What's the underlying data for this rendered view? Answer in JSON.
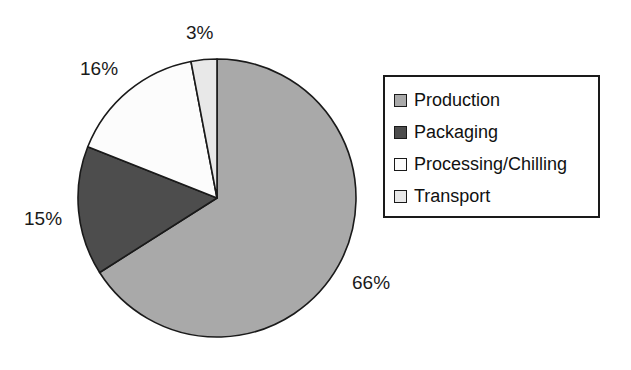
{
  "chart_data": {
    "type": "pie",
    "title": "",
    "subtitle": "",
    "xlabel": "",
    "ylabel": "",
    "legend_position": "right",
    "grid": false,
    "start_angle_deg": 0,
    "direction": "clockwise",
    "categories": [
      "Production",
      "Packaging",
      "Processing/Chilling",
      "Transport"
    ],
    "values": [
      66,
      15,
      16,
      3
    ],
    "value_unit": "%",
    "data_labels": [
      "66%",
      "15%",
      "16%",
      "3%"
    ],
    "colors": [
      "#a9a9a9",
      "#4d4d4d",
      "#fcfcfc",
      "#e8e8e8"
    ],
    "slices": [
      {
        "label": "Production",
        "value": 66,
        "display": "66%",
        "color": "#a9a9a9"
      },
      {
        "label": "Packaging",
        "value": 15,
        "display": "15%",
        "color": "#4d4d4d"
      },
      {
        "label": "Processing/Chilling",
        "value": 16,
        "display": "16%",
        "color": "#fcfcfc"
      },
      {
        "label": "Transport",
        "value": 3,
        "display": "3%",
        "color": "#e8e8e8"
      }
    ]
  },
  "labels": {
    "production": "66%",
    "packaging": "15%",
    "processing": "16%",
    "transport": "3%"
  },
  "legend": {
    "items": [
      {
        "label": "Production",
        "swatch": "#a9a9a9"
      },
      {
        "label": "Packaging",
        "swatch": "#4d4d4d"
      },
      {
        "label": "Processing/Chilling",
        "swatch": "#fcfcfc"
      },
      {
        "label": "Transport",
        "swatch": "#e8e8e8"
      }
    ]
  },
  "style": {
    "outline": "#1a1a1a",
    "background": "#ffffff",
    "text": "#111111"
  }
}
